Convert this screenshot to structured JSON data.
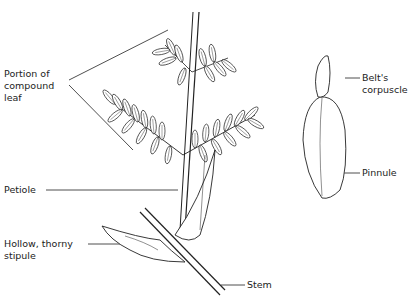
{
  "diagram": {
    "labels": {
      "compound_leaf_line1": "Portion of",
      "compound_leaf_line2": "compound",
      "compound_leaf_line3": "leaf",
      "petiole": "Petiole",
      "stipule_line1": "Hollow, thorny",
      "stipule_line2": "stipule",
      "stem": "Stem",
      "belts_line1": "Belt's",
      "belts_line2": "corpuscle",
      "pinnule": "Pinnule"
    },
    "colors": {
      "ink": "#222222",
      "background": "#ffffff"
    }
  }
}
